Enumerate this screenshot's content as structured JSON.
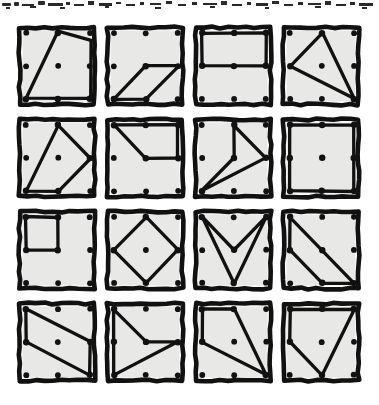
{
  "page": {
    "background_color": "#ffffff",
    "ink_color": "#111111",
    "card_fill_color": "#e8e8e6",
    "card_count": 16,
    "grid_rows": 4,
    "grid_columns": 4,
    "dot_grid": "3x3",
    "top_edge_artifact": "scanned-page-smudge"
  },
  "cards": [
    {
      "id": "card-1",
      "row": 1,
      "column": 1,
      "shape_name": "quadrilateral-leaning-trapezoid",
      "vertex_pegs": [
        "top-center",
        "right-bottom-corner",
        "bottom-center",
        "left-bottom-corner"
      ],
      "points": "44,10 76,78 44,78 12,78",
      "polygon": "44,9 77,18 77,76 12,76",
      "closed": true,
      "dots": [
        {
          "cx": 12,
          "cy": 11,
          "on_shape": false
        },
        {
          "cx": 44,
          "cy": 11,
          "on_shape": true
        },
        {
          "cx": 76,
          "cy": 11,
          "on_shape": false
        },
        {
          "cx": 12,
          "cy": 44,
          "on_shape": false
        },
        {
          "cx": 44,
          "cy": 44,
          "on_shape": false
        },
        {
          "cx": 76,
          "cy": 44,
          "on_shape": false
        },
        {
          "cx": 12,
          "cy": 77,
          "on_shape": true
        },
        {
          "cx": 44,
          "cy": 77,
          "on_shape": true
        },
        {
          "cx": 76,
          "cy": 77,
          "on_shape": true
        }
      ]
    },
    {
      "id": "card-2",
      "row": 1,
      "column": 2,
      "shape_name": "parallelogram",
      "vertex_pegs": [
        "center",
        "right-middle",
        "bottom-center",
        "left-bottom-corner"
      ],
      "polygon": "44,44 77,44 44,77 12,77",
      "closed": true,
      "dots": [
        {
          "cx": 12,
          "cy": 11,
          "on_shape": false
        },
        {
          "cx": 44,
          "cy": 11,
          "on_shape": false
        },
        {
          "cx": 76,
          "cy": 11,
          "on_shape": false
        },
        {
          "cx": 12,
          "cy": 44,
          "on_shape": false
        },
        {
          "cx": 44,
          "cy": 44,
          "on_shape": true
        },
        {
          "cx": 76,
          "cy": 44,
          "on_shape": false
        },
        {
          "cx": 12,
          "cy": 77,
          "on_shape": true
        },
        {
          "cx": 44,
          "cy": 77,
          "on_shape": true
        },
        {
          "cx": 76,
          "cy": 77,
          "on_shape": false
        }
      ]
    },
    {
      "id": "card-3",
      "row": 1,
      "column": 3,
      "shape_name": "rectangle-upper-half",
      "vertex_pegs": [
        "left-top-corner",
        "right-top-corner",
        "right-middle",
        "left-middle"
      ],
      "polygon": "12,11 76,11 76,44 12,44",
      "closed": true,
      "dots": [
        {
          "cx": 12,
          "cy": 11,
          "on_shape": true
        },
        {
          "cx": 44,
          "cy": 11,
          "on_shape": true
        },
        {
          "cx": 76,
          "cy": 11,
          "on_shape": true
        },
        {
          "cx": 12,
          "cy": 44,
          "on_shape": true
        },
        {
          "cx": 44,
          "cy": 44,
          "on_shape": true
        },
        {
          "cx": 76,
          "cy": 44,
          "on_shape": true
        },
        {
          "cx": 12,
          "cy": 77,
          "on_shape": false
        },
        {
          "cx": 44,
          "cy": 77,
          "on_shape": false
        },
        {
          "cx": 76,
          "cy": 77,
          "on_shape": false
        }
      ]
    },
    {
      "id": "card-4",
      "row": 1,
      "column": 4,
      "shape_name": "arrow-chevron-pointing-left",
      "vertex_pegs": [
        "top-center",
        "left-middle",
        "right-bottom-corner"
      ],
      "polygon": "44,11 12,44 76,77",
      "closed": true,
      "dots": [
        {
          "cx": 12,
          "cy": 11,
          "on_shape": false
        },
        {
          "cx": 44,
          "cy": 11,
          "on_shape": true
        },
        {
          "cx": 76,
          "cy": 11,
          "on_shape": false
        },
        {
          "cx": 12,
          "cy": 44,
          "on_shape": true
        },
        {
          "cx": 44,
          "cy": 44,
          "on_shape": false
        },
        {
          "cx": 76,
          "cy": 44,
          "on_shape": false
        },
        {
          "cx": 12,
          "cy": 77,
          "on_shape": false
        },
        {
          "cx": 44,
          "cy": 77,
          "on_shape": false
        },
        {
          "cx": 76,
          "cy": 77,
          "on_shape": true
        }
      ]
    },
    {
      "id": "card-5",
      "row": 2,
      "column": 1,
      "shape_name": "pentagon",
      "vertex_pegs": [
        "top-center",
        "right-middle",
        "bottom-center",
        "left-bottom-corner"
      ],
      "polygon": "44,11 76,44 44,77 12,77",
      "closed": true,
      "dots": [
        {
          "cx": 12,
          "cy": 11,
          "on_shape": false
        },
        {
          "cx": 44,
          "cy": 11,
          "on_shape": true
        },
        {
          "cx": 76,
          "cy": 11,
          "on_shape": false
        },
        {
          "cx": 12,
          "cy": 44,
          "on_shape": false
        },
        {
          "cx": 44,
          "cy": 44,
          "on_shape": false
        },
        {
          "cx": 76,
          "cy": 44,
          "on_shape": true
        },
        {
          "cx": 12,
          "cy": 77,
          "on_shape": true
        },
        {
          "cx": 44,
          "cy": 77,
          "on_shape": true
        },
        {
          "cx": 76,
          "cy": 77,
          "on_shape": false
        }
      ]
    },
    {
      "id": "card-6",
      "row": 2,
      "column": 2,
      "shape_name": "quadrilateral-upper-with-notch",
      "vertex_pegs": [
        "left-top-corner",
        "top-center",
        "right-top-corner",
        "right-middle",
        "center"
      ],
      "polygon": "12,11 76,11 76,44 44,44",
      "closed": true,
      "dots": [
        {
          "cx": 12,
          "cy": 11,
          "on_shape": true
        },
        {
          "cx": 44,
          "cy": 11,
          "on_shape": true
        },
        {
          "cx": 76,
          "cy": 11,
          "on_shape": true
        },
        {
          "cx": 12,
          "cy": 44,
          "on_shape": false
        },
        {
          "cx": 44,
          "cy": 44,
          "on_shape": true
        },
        {
          "cx": 76,
          "cy": 44,
          "on_shape": true
        },
        {
          "cx": 12,
          "cy": 77,
          "on_shape": false
        },
        {
          "cx": 44,
          "cy": 77,
          "on_shape": false
        },
        {
          "cx": 76,
          "cy": 77,
          "on_shape": false
        }
      ]
    },
    {
      "id": "card-7",
      "row": 2,
      "column": 3,
      "shape_name": "arrow-chevron-pointing-left",
      "vertex_pegs": [
        "top-center",
        "center",
        "right-middle",
        "left-bottom-corner"
      ],
      "polygon": "44,11 76,44 12,77 44,44",
      "closed": true,
      "dots": [
        {
          "cx": 12,
          "cy": 11,
          "on_shape": false
        },
        {
          "cx": 44,
          "cy": 11,
          "on_shape": true
        },
        {
          "cx": 76,
          "cy": 11,
          "on_shape": false
        },
        {
          "cx": 12,
          "cy": 44,
          "on_shape": false
        },
        {
          "cx": 44,
          "cy": 44,
          "on_shape": true
        },
        {
          "cx": 76,
          "cy": 44,
          "on_shape": true
        },
        {
          "cx": 12,
          "cy": 77,
          "on_shape": true
        },
        {
          "cx": 44,
          "cy": 77,
          "on_shape": false
        },
        {
          "cx": 76,
          "cy": 77,
          "on_shape": false
        }
      ]
    },
    {
      "id": "card-8",
      "row": 2,
      "column": 4,
      "shape_name": "square-full-perimeter",
      "vertex_pegs": [
        "left-top-corner",
        "right-top-corner",
        "right-bottom-corner",
        "left-bottom-corner"
      ],
      "polygon": "12,11 76,11 76,77 12,77",
      "closed": true,
      "dots": [
        {
          "cx": 12,
          "cy": 11,
          "on_shape": true
        },
        {
          "cx": 44,
          "cy": 11,
          "on_shape": true
        },
        {
          "cx": 76,
          "cy": 11,
          "on_shape": true
        },
        {
          "cx": 12,
          "cy": 44,
          "on_shape": true
        },
        {
          "cx": 44,
          "cy": 44,
          "on_shape": true
        },
        {
          "cx": 76,
          "cy": 44,
          "on_shape": true
        },
        {
          "cx": 12,
          "cy": 77,
          "on_shape": true
        },
        {
          "cx": 44,
          "cy": 77,
          "on_shape": true
        },
        {
          "cx": 76,
          "cy": 77,
          "on_shape": true
        }
      ]
    },
    {
      "id": "card-9",
      "row": 3,
      "column": 1,
      "shape_name": "small-square-top-left",
      "vertex_pegs": [
        "left-top-corner",
        "top-center",
        "center",
        "left-middle"
      ],
      "polygon": "12,11 44,11 44,44 12,44",
      "closed": true,
      "dots": [
        {
          "cx": 12,
          "cy": 11,
          "on_shape": true
        },
        {
          "cx": 44,
          "cy": 11,
          "on_shape": true
        },
        {
          "cx": 76,
          "cy": 11,
          "on_shape": false
        },
        {
          "cx": 12,
          "cy": 44,
          "on_shape": true
        },
        {
          "cx": 44,
          "cy": 44,
          "on_shape": true
        },
        {
          "cx": 76,
          "cy": 44,
          "on_shape": false
        },
        {
          "cx": 12,
          "cy": 77,
          "on_shape": false
        },
        {
          "cx": 44,
          "cy": 77,
          "on_shape": false
        },
        {
          "cx": 76,
          "cy": 77,
          "on_shape": false
        }
      ]
    },
    {
      "id": "card-10",
      "row": 3,
      "column": 2,
      "shape_name": "diamond-rotated-square",
      "vertex_pegs": [
        "top-center",
        "right-middle",
        "bottom-center",
        "left-middle"
      ],
      "polygon": "44,11 76,44 44,77 12,44",
      "closed": true,
      "dots": [
        {
          "cx": 12,
          "cy": 11,
          "on_shape": false
        },
        {
          "cx": 44,
          "cy": 11,
          "on_shape": true
        },
        {
          "cx": 76,
          "cy": 11,
          "on_shape": false
        },
        {
          "cx": 12,
          "cy": 44,
          "on_shape": true
        },
        {
          "cx": 44,
          "cy": 44,
          "on_shape": false
        },
        {
          "cx": 76,
          "cy": 44,
          "on_shape": true
        },
        {
          "cx": 12,
          "cy": 77,
          "on_shape": false
        },
        {
          "cx": 44,
          "cy": 77,
          "on_shape": true
        },
        {
          "cx": 76,
          "cy": 77,
          "on_shape": false
        }
      ]
    },
    {
      "id": "card-11",
      "row": 3,
      "column": 3,
      "shape_name": "v-chevron-pointing-down",
      "vertex_pegs": [
        "left-top-corner",
        "center",
        "right-top-corner",
        "bottom-center"
      ],
      "polygon": "12,11 44,44 76,11 44,77",
      "closed": true,
      "dots": [
        {
          "cx": 12,
          "cy": 11,
          "on_shape": true
        },
        {
          "cx": 44,
          "cy": 11,
          "on_shape": false
        },
        {
          "cx": 76,
          "cy": 11,
          "on_shape": true
        },
        {
          "cx": 12,
          "cy": 44,
          "on_shape": false
        },
        {
          "cx": 44,
          "cy": 44,
          "on_shape": true
        },
        {
          "cx": 76,
          "cy": 44,
          "on_shape": false
        },
        {
          "cx": 12,
          "cy": 77,
          "on_shape": false
        },
        {
          "cx": 44,
          "cy": 77,
          "on_shape": true
        },
        {
          "cx": 76,
          "cy": 77,
          "on_shape": false
        }
      ]
    },
    {
      "id": "card-12",
      "row": 3,
      "column": 4,
      "shape_name": "right-triangle-diagonal",
      "vertex_pegs": [
        "left-top-corner",
        "left-middle",
        "bottom-center",
        "right-bottom-corner"
      ],
      "polygon": "12,11 76,77 44,77 12,44",
      "closed": true,
      "dots": [
        {
          "cx": 12,
          "cy": 11,
          "on_shape": true
        },
        {
          "cx": 44,
          "cy": 11,
          "on_shape": false
        },
        {
          "cx": 76,
          "cy": 11,
          "on_shape": false
        },
        {
          "cx": 12,
          "cy": 44,
          "on_shape": true
        },
        {
          "cx": 44,
          "cy": 44,
          "on_shape": true
        },
        {
          "cx": 76,
          "cy": 44,
          "on_shape": false
        },
        {
          "cx": 12,
          "cy": 77,
          "on_shape": false
        },
        {
          "cx": 44,
          "cy": 77,
          "on_shape": true
        },
        {
          "cx": 76,
          "cy": 77,
          "on_shape": true
        }
      ]
    },
    {
      "id": "card-13",
      "row": 4,
      "column": 1,
      "shape_name": "wide-slanted-parallelogram",
      "vertex_pegs": [
        "left-top-corner",
        "right-middle",
        "right-bottom-corner",
        "left-middle"
      ],
      "polygon": "12,11 76,44 76,77 12,44",
      "closed": true,
      "dots": [
        {
          "cx": 12,
          "cy": 11,
          "on_shape": true
        },
        {
          "cx": 44,
          "cy": 11,
          "on_shape": false
        },
        {
          "cx": 76,
          "cy": 11,
          "on_shape": false
        },
        {
          "cx": 12,
          "cy": 44,
          "on_shape": true
        },
        {
          "cx": 44,
          "cy": 44,
          "on_shape": false
        },
        {
          "cx": 76,
          "cy": 44,
          "on_shape": true
        },
        {
          "cx": 12,
          "cy": 77,
          "on_shape": false
        },
        {
          "cx": 44,
          "cy": 77,
          "on_shape": false
        },
        {
          "cx": 76,
          "cy": 77,
          "on_shape": true
        }
      ]
    },
    {
      "id": "card-14",
      "row": 4,
      "column": 2,
      "shape_name": "arrow-chevron-pointing-right",
      "vertex_pegs": [
        "left-top-corner",
        "center",
        "right-middle",
        "left-bottom-corner"
      ],
      "polygon": "12,11 44,44 76,44 12,77",
      "closed": true,
      "dots": [
        {
          "cx": 12,
          "cy": 11,
          "on_shape": true
        },
        {
          "cx": 44,
          "cy": 11,
          "on_shape": false
        },
        {
          "cx": 76,
          "cy": 11,
          "on_shape": false
        },
        {
          "cx": 12,
          "cy": 44,
          "on_shape": true
        },
        {
          "cx": 44,
          "cy": 44,
          "on_shape": true
        },
        {
          "cx": 76,
          "cy": 44,
          "on_shape": true
        },
        {
          "cx": 12,
          "cy": 77,
          "on_shape": true
        },
        {
          "cx": 44,
          "cy": 77,
          "on_shape": false
        },
        {
          "cx": 76,
          "cy": 77,
          "on_shape": false
        }
      ]
    },
    {
      "id": "card-15",
      "row": 4,
      "column": 3,
      "shape_name": "quadrilateral-slanted",
      "vertex_pegs": [
        "left-top-corner",
        "top-center",
        "right-bottom-corner",
        "left-middle"
      ],
      "polygon": "12,11 44,11 76,77 12,44",
      "closed": true,
      "dots": [
        {
          "cx": 12,
          "cy": 11,
          "on_shape": true
        },
        {
          "cx": 44,
          "cy": 11,
          "on_shape": true
        },
        {
          "cx": 76,
          "cy": 11,
          "on_shape": false
        },
        {
          "cx": 12,
          "cy": 44,
          "on_shape": true
        },
        {
          "cx": 44,
          "cy": 44,
          "on_shape": false
        },
        {
          "cx": 76,
          "cy": 44,
          "on_shape": false
        },
        {
          "cx": 12,
          "cy": 77,
          "on_shape": false
        },
        {
          "cx": 44,
          "cy": 77,
          "on_shape": false
        },
        {
          "cx": 76,
          "cy": 77,
          "on_shape": true
        }
      ]
    },
    {
      "id": "card-16",
      "row": 4,
      "column": 4,
      "shape_name": "quadrilateral-pointed-down",
      "vertex_pegs": [
        "left-top-corner",
        "top-center",
        "right-top-corner",
        "bottom-center",
        "left-middle"
      ],
      "polygon": "12,11 76,11 44,77 12,44",
      "closed": true,
      "dots": [
        {
          "cx": 12,
          "cy": 11,
          "on_shape": true
        },
        {
          "cx": 44,
          "cy": 11,
          "on_shape": true
        },
        {
          "cx": 76,
          "cy": 11,
          "on_shape": true
        },
        {
          "cx": 12,
          "cy": 44,
          "on_shape": true
        },
        {
          "cx": 44,
          "cy": 44,
          "on_shape": false
        },
        {
          "cx": 76,
          "cy": 44,
          "on_shape": false
        },
        {
          "cx": 12,
          "cy": 77,
          "on_shape": false
        },
        {
          "cx": 44,
          "cy": 77,
          "on_shape": true
        },
        {
          "cx": 76,
          "cy": 77,
          "on_shape": false
        }
      ]
    }
  ]
}
